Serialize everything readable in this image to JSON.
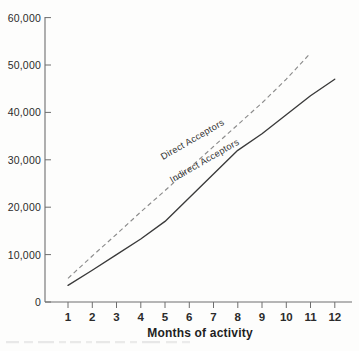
{
  "chart_data": {
    "type": "line",
    "title": "",
    "subtitle": "",
    "xlabel": "Months of activity",
    "ylabel": "",
    "xlim": [
      0.5,
      12.8
    ],
    "ylim": [
      0,
      60000
    ],
    "grid": false,
    "legend_position": "inline-annotation",
    "x": [
      1,
      2,
      3,
      4,
      5,
      6,
      7,
      8,
      9,
      10,
      11,
      12
    ],
    "x_tick_labels": [
      "1",
      "2",
      "3",
      "4",
      "5",
      "6",
      "7",
      "8",
      "9",
      "10",
      "11",
      "12"
    ],
    "y_ticks": [
      0,
      10000,
      20000,
      30000,
      40000,
      50000,
      60000
    ],
    "y_tick_labels": [
      "0",
      "10,000",
      "20,000",
      "30,000",
      "40,000",
      "50,000",
      "60,000"
    ],
    "series": [
      {
        "name": "Direct Acceptors",
        "style": "dashed",
        "color": "#8c8c8c",
        "x": [
          1,
          2,
          3,
          4,
          5,
          6,
          7,
          8,
          9,
          10,
          11
        ],
        "values": [
          5000,
          9700,
          14300,
          19000,
          23500,
          28200,
          32800,
          37400,
          42000,
          47000,
          52500
        ]
      },
      {
        "name": "Indirect Acceptors",
        "style": "solid",
        "color": "#3a3a3a",
        "x": [
          1,
          2,
          3,
          4,
          5,
          6,
          7,
          8,
          9,
          10,
          11,
          12
        ],
        "values": [
          3500,
          6700,
          10000,
          13300,
          17000,
          22000,
          27000,
          32000,
          35500,
          39500,
          43500,
          47000
        ]
      }
    ],
    "annotations": [
      {
        "text": "Direct Acceptors",
        "series": "Direct Acceptors"
      },
      {
        "text": "Indirect Acceptors",
        "series": "Indirect Acceptors"
      }
    ]
  },
  "figure": {
    "axis_title": "Months of activity",
    "series_label_direct": "Direct Acceptors",
    "series_label_indirect": "Indirect Acceptors",
    "y_labels": {
      "t0": "0",
      "t1": "10,000",
      "t2": "20,000",
      "t3": "30,000",
      "t4": "40,000",
      "t5": "50,000",
      "t6": "60,000"
    },
    "x_labels": {
      "m1": "1",
      "m2": "2",
      "m3": "3",
      "m4": "4",
      "m5": "5",
      "m6": "6",
      "m7": "7",
      "m8": "8",
      "m9": "9",
      "m10": "10",
      "m11": "11",
      "m12": "12"
    },
    "caption": ""
  },
  "colors": {
    "background": "#fdfdfc",
    "axis": "#6e6e6e",
    "text": "#2b2b2b",
    "direct_series": "#8c8c8c",
    "indirect_series": "#3a3a3a"
  }
}
